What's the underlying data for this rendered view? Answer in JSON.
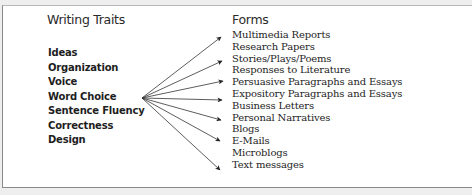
{
  "traits": {
    "heading": "Writing Traits",
    "items": [
      "Ideas",
      "Organization",
      "Voice",
      "Word Choice",
      "Sentence Fluency",
      "Correctness",
      "Design"
    ]
  },
  "forms": {
    "heading": "Forms",
    "items": [
      "Multimedia Reports",
      "Research Papers",
      "Stories/Plays/Poems",
      "Responses to Literature",
      "Persuasive Paragraphs and Essays",
      "Expository Paragraphs and Essays",
      "Business Letters",
      "Personal Narratives",
      "Blogs",
      "E-Mails",
      "Microblogs",
      "Text messages"
    ]
  },
  "arrows": {
    "origin": [
      142,
      98
    ],
    "tips": [
      [
        221,
        37
      ],
      [
        222,
        61
      ],
      [
        223,
        81
      ],
      [
        222,
        100
      ],
      [
        221,
        120
      ],
      [
        220,
        141
      ],
      [
        220,
        170
      ]
    ],
    "color": "#333333"
  },
  "colors": {
    "background": "#eeeeee",
    "panel": "#ffffff",
    "border": "#8a8a8a",
    "text": "#1e1e1e"
  }
}
